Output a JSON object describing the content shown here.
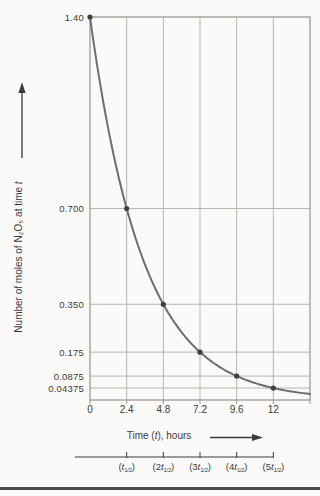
{
  "figure": {
    "background": "#fbfaf8",
    "bottom_rule_color": "#4d4d4d"
  },
  "chart_data": {
    "type": "line",
    "title": "",
    "xlabel_parts": {
      "pre": "Time (",
      "italic_var": "t",
      "post": "), hours"
    },
    "ylabel_parts": {
      "pre": "Number of moles of N₂O₅ at time ",
      "italic_var": "t"
    },
    "xlim": [
      0,
      14.4
    ],
    "ylim": [
      0,
      1.4
    ],
    "grid": true,
    "x_ticks": [
      {
        "t": 0,
        "label": "0"
      },
      {
        "t": 2.4,
        "label": "2.4"
      },
      {
        "t": 4.8,
        "label": "4.8"
      },
      {
        "t": 7.2,
        "label": "7.2"
      },
      {
        "t": 9.6,
        "label": "9.6"
      },
      {
        "t": 12,
        "label": "12"
      }
    ],
    "y_ticks": [
      {
        "v": 1.4,
        "label": "1.40"
      },
      {
        "v": 0.7,
        "label": "0.700"
      },
      {
        "v": 0.35,
        "label": "0.350"
      },
      {
        "v": 0.175,
        "label": "0.175"
      },
      {
        "v": 0.0875,
        "label": "0.0875"
      },
      {
        "v": 0.04375,
        "label": "0.04375"
      }
    ],
    "curve": {
      "initial_moles": 1.4,
      "half_life_hours": 2.4,
      "t_start": 0,
      "t_end": 14.4
    },
    "data_points": [
      [
        0,
        1.4
      ],
      [
        2.4,
        0.7
      ],
      [
        4.8,
        0.35
      ],
      [
        7.2,
        0.175
      ],
      [
        9.6,
        0.0875
      ],
      [
        12,
        0.04375
      ]
    ],
    "half_life_axis": {
      "ruler_start_t": -1.0,
      "ruler_end_t": 12,
      "tick_times": [
        2.4,
        4.8,
        7.2,
        9.6,
        12
      ],
      "labels": [
        {
          "pre": "(",
          "coef": "",
          "var": "t",
          "sub": "1/2",
          "post": ")"
        },
        {
          "pre": "(",
          "coef": "2",
          "var": "t",
          "sub": "1/2",
          "post": ")"
        },
        {
          "pre": "(",
          "coef": "3",
          "var": "t",
          "sub": "1/2",
          "post": ")"
        },
        {
          "pre": "(",
          "coef": "4",
          "var": "t",
          "sub": "1/2",
          "post": ")"
        },
        {
          "pre": "(",
          "coef": "5",
          "var": "t",
          "sub": "1/2",
          "post": ")"
        }
      ]
    },
    "colors": {
      "curve": "#6e6e6e",
      "point": "#3f3f3f",
      "grid": "#b9b4ae",
      "frame": "#97918b",
      "axis_ink": "#3b3b3b",
      "text": "#3b3b3b"
    }
  }
}
